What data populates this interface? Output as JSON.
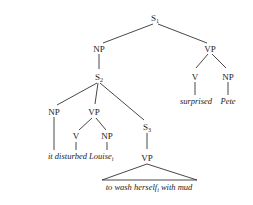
{
  "diagram": {
    "type": "syntax-tree",
    "nodes": {
      "s1": {
        "label": "S",
        "sub": "1"
      },
      "np_top": {
        "label": "NP"
      },
      "s2": {
        "label": "S",
        "sub": "2"
      },
      "vp_top": {
        "label": "VP"
      },
      "v_top": {
        "label": "V"
      },
      "np_pete": {
        "label": "NP"
      },
      "np_it": {
        "label": "NP"
      },
      "vp_mid": {
        "label": "VP"
      },
      "v_mid": {
        "label": "V"
      },
      "np_louise": {
        "label": "NP"
      },
      "s3": {
        "label": "S",
        "sub": "3"
      },
      "vp_low": {
        "label": "VP"
      }
    },
    "leaves": {
      "surprised": "surprised",
      "pete": "Pete",
      "it": "it",
      "disturbed": "disturbed",
      "louise": "Louise",
      "louise_sub": "i",
      "triangle_pre": "to wash herself",
      "triangle_sub": "i",
      "triangle_post": " with mud"
    }
  }
}
